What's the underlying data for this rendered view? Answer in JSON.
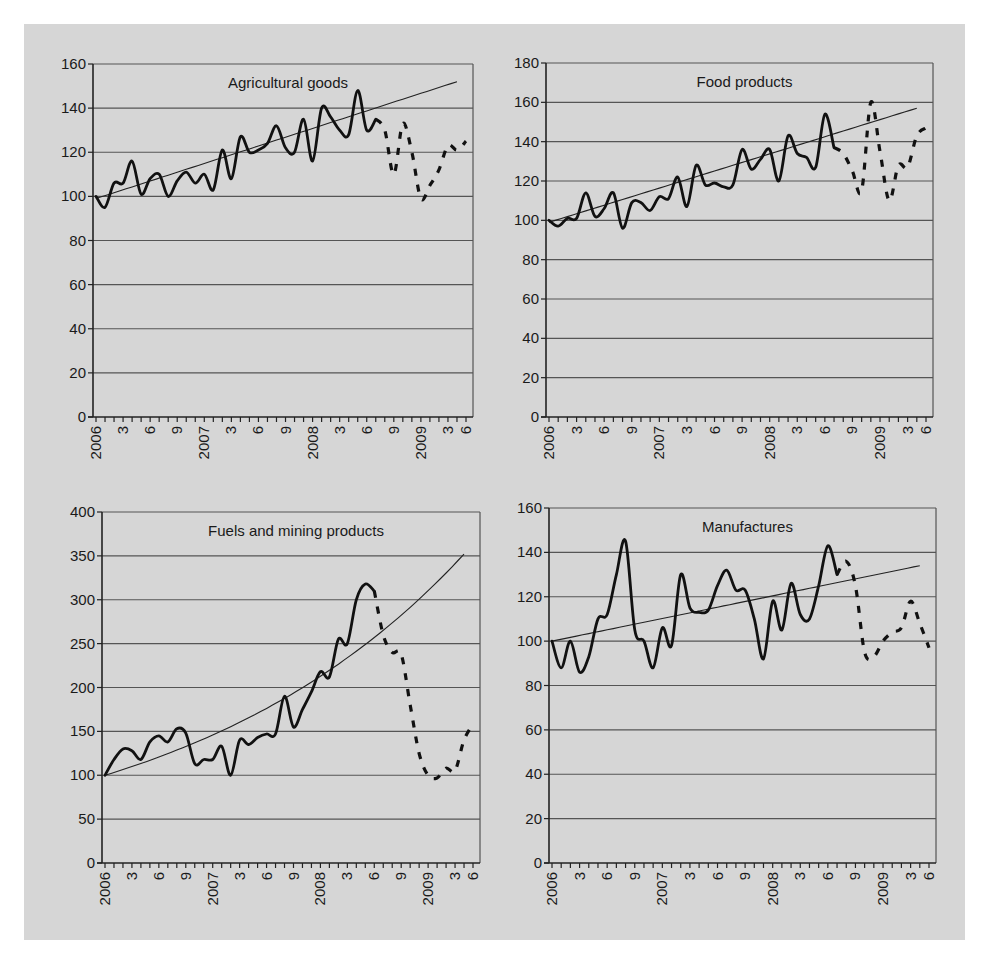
{
  "figure": {
    "background": "#d6d6d6",
    "line_color": "#111111",
    "grid_color": "#555555"
  },
  "x_axis": {
    "months": 42,
    "tick_labels": [
      {
        "index": 0,
        "label": "2006"
      },
      {
        "index": 3,
        "label": "3"
      },
      {
        "index": 6,
        "label": "6"
      },
      {
        "index": 9,
        "label": "9"
      },
      {
        "index": 12,
        "label": "2007"
      },
      {
        "index": 15,
        "label": "3"
      },
      {
        "index": 18,
        "label": "6"
      },
      {
        "index": 21,
        "label": "9"
      },
      {
        "index": 24,
        "label": "2008"
      },
      {
        "index": 27,
        "label": "3"
      },
      {
        "index": 30,
        "label": "6"
      },
      {
        "index": 33,
        "label": "9"
      },
      {
        "index": 36,
        "label": "2009"
      },
      {
        "index": 39,
        "label": "3"
      },
      {
        "index": 41,
        "label": "6"
      }
    ]
  },
  "chart_data": [
    {
      "type": "line",
      "title": "Agricultural goods",
      "xlabel": "",
      "ylabel": "",
      "ylim": [
        0,
        160
      ],
      "yticks": [
        0,
        20,
        40,
        60,
        80,
        100,
        120,
        140,
        160
      ],
      "grid": true,
      "solid_until_index": 31,
      "x": [
        "2006-01",
        "2006-02",
        "2006-03",
        "2006-04",
        "2006-05",
        "2006-06",
        "2006-07",
        "2006-08",
        "2006-09",
        "2006-10",
        "2006-11",
        "2006-12",
        "2007-01",
        "2007-02",
        "2007-03",
        "2007-04",
        "2007-05",
        "2007-06",
        "2007-07",
        "2007-08",
        "2007-09",
        "2007-10",
        "2007-11",
        "2007-12",
        "2008-01",
        "2008-02",
        "2008-03",
        "2008-04",
        "2008-05",
        "2008-06",
        "2008-07",
        "2008-08",
        "2008-09",
        "2008-10",
        "2008-11",
        "2008-12",
        "2009-01",
        "2009-02",
        "2009-03",
        "2009-04",
        "2009-05",
        "2009-06"
      ],
      "series": [
        {
          "name": "Monthly index",
          "style": "solid-then-dashed",
          "values": [
            100,
            95,
            106,
            106,
            116,
            101,
            108,
            110,
            100,
            107,
            111,
            106,
            110,
            103,
            121,
            108,
            127,
            120,
            121,
            124,
            132,
            122,
            120,
            135,
            116,
            140,
            136,
            130,
            128,
            148,
            130,
            135,
            130,
            110,
            133,
            120,
            99,
            105,
            112,
            123,
            121,
            125
          ]
        },
        {
          "name": "Trend",
          "style": "thin",
          "values_endpoints": [
            99,
            152
          ]
        }
      ],
      "trend": {
        "start": 99,
        "end": 152,
        "shape": "linear"
      },
      "panel": {
        "x0": 93,
        "x1": 473,
        "y0": 64,
        "y1": 417
      }
    },
    {
      "type": "line",
      "title": "Food products",
      "xlabel": "",
      "ylabel": "",
      "ylim": [
        0,
        180
      ],
      "yticks": [
        0,
        20,
        40,
        60,
        80,
        100,
        120,
        140,
        160,
        180
      ],
      "grid": true,
      "solid_until_index": 31,
      "x": [
        "2006-01",
        "2006-02",
        "2006-03",
        "2006-04",
        "2006-05",
        "2006-06",
        "2006-07",
        "2006-08",
        "2006-09",
        "2006-10",
        "2006-11",
        "2006-12",
        "2007-01",
        "2007-02",
        "2007-03",
        "2007-04",
        "2007-05",
        "2007-06",
        "2007-07",
        "2007-08",
        "2007-09",
        "2007-10",
        "2007-11",
        "2007-12",
        "2008-01",
        "2008-02",
        "2008-03",
        "2008-04",
        "2008-05",
        "2008-06",
        "2008-07",
        "2008-08",
        "2008-09",
        "2008-10",
        "2008-11",
        "2008-12",
        "2009-01",
        "2009-02",
        "2009-03",
        "2009-04",
        "2009-05",
        "2009-06"
      ],
      "series": [
        {
          "name": "Monthly index",
          "style": "solid-then-dashed",
          "values": [
            100,
            97,
            101,
            101,
            114,
            102,
            106,
            114,
            96,
            109,
            109,
            105,
            112,
            111,
            122,
            107,
            128,
            118,
            119,
            117,
            118,
            136,
            126,
            131,
            136,
            120,
            143,
            134,
            132,
            127,
            154,
            137,
            134,
            125,
            115,
            160,
            135,
            110,
            128,
            127,
            143,
            147
          ]
        },
        {
          "name": "Trend",
          "style": "thin",
          "values_endpoints": [
            99,
            157
          ]
        }
      ],
      "trend": {
        "start": 99,
        "end": 157,
        "shape": "linear"
      },
      "panel": {
        "x0": 546,
        "x1": 933,
        "y0": 63,
        "y1": 417
      }
    },
    {
      "type": "line",
      "title": "Fuels and mining products",
      "xlabel": "",
      "ylabel": "",
      "ylim": [
        0,
        400
      ],
      "yticks": [
        0,
        50,
        100,
        150,
        200,
        250,
        300,
        350,
        400
      ],
      "grid": true,
      "solid_until_index": 30,
      "x": [
        "2006-01",
        "2006-02",
        "2006-03",
        "2006-04",
        "2006-05",
        "2006-06",
        "2006-07",
        "2006-08",
        "2006-09",
        "2006-10",
        "2006-11",
        "2006-12",
        "2007-01",
        "2007-02",
        "2007-03",
        "2007-04",
        "2007-05",
        "2007-06",
        "2007-07",
        "2007-08",
        "2007-09",
        "2007-10",
        "2007-11",
        "2007-12",
        "2008-01",
        "2008-02",
        "2008-03",
        "2008-04",
        "2008-05",
        "2008-06",
        "2008-07",
        "2008-08",
        "2008-09",
        "2008-10",
        "2008-11",
        "2008-12",
        "2009-01",
        "2009-02",
        "2009-03",
        "2009-04",
        "2009-05",
        "2009-06"
      ],
      "series": [
        {
          "name": "Monthly index",
          "style": "solid-then-dashed",
          "values": [
            100,
            118,
            130,
            128,
            118,
            138,
            145,
            138,
            153,
            148,
            113,
            118,
            118,
            133,
            100,
            140,
            135,
            143,
            147,
            147,
            190,
            155,
            175,
            195,
            218,
            212,
            255,
            250,
            300,
            318,
            310,
            260,
            240,
            238,
            180,
            125,
            100,
            97,
            108,
            105,
            140,
            158
          ]
        },
        {
          "name": "Trend",
          "style": "thin",
          "values_endpoints": [
            100,
            352
          ]
        }
      ],
      "trend": {
        "start": 100,
        "end": 352,
        "shape": "exponential"
      },
      "panel": {
        "x0": 102,
        "x1": 480,
        "y0": 512,
        "y1": 863
      }
    },
    {
      "type": "line",
      "title": "Manufactures",
      "xlabel": "",
      "ylabel": "",
      "ylim": [
        0,
        160
      ],
      "yticks": [
        0,
        20,
        40,
        60,
        80,
        100,
        120,
        140,
        160
      ],
      "grid": true,
      "solid_until_index": 31,
      "x": [
        "2006-01",
        "2006-02",
        "2006-03",
        "2006-04",
        "2006-05",
        "2006-06",
        "2006-07",
        "2006-08",
        "2006-09",
        "2006-10",
        "2006-11",
        "2006-12",
        "2007-01",
        "2007-02",
        "2007-03",
        "2007-04",
        "2007-05",
        "2007-06",
        "2007-07",
        "2007-08",
        "2007-09",
        "2007-10",
        "2007-11",
        "2007-12",
        "2008-01",
        "2008-02",
        "2008-03",
        "2008-04",
        "2008-05",
        "2008-06",
        "2008-07",
        "2008-08",
        "2008-09",
        "2008-10",
        "2008-11",
        "2008-12",
        "2009-01",
        "2009-02",
        "2009-03",
        "2009-04",
        "2009-05",
        "2009-06"
      ],
      "series": [
        {
          "name": "Monthly index",
          "style": "solid-then-dashed",
          "values": [
            100,
            88,
            100,
            86,
            93,
            110,
            112,
            130,
            145,
            105,
            100,
            88,
            106,
            98,
            130,
            115,
            113,
            114,
            125,
            132,
            123,
            123,
            110,
            92,
            118,
            105,
            126,
            112,
            110,
            125,
            143,
            130,
            136,
            125,
            95,
            93,
            100,
            104,
            106,
            118,
            108,
            97
          ]
        },
        {
          "name": "Trend",
          "style": "thin",
          "values_endpoints": [
            100,
            134
          ]
        }
      ],
      "trend": {
        "start": 100,
        "end": 134,
        "shape": "linear"
      },
      "panel": {
        "x0": 549,
        "x1": 936,
        "y0": 508,
        "y1": 863
      }
    }
  ]
}
